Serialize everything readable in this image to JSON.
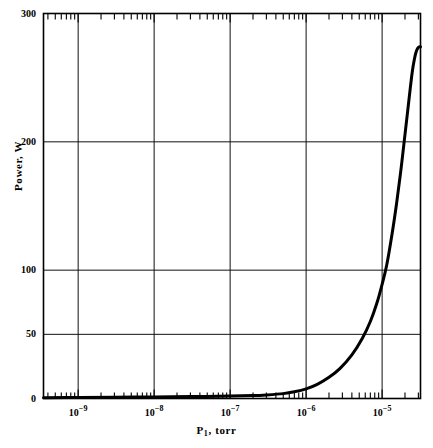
{
  "chart_data": {
    "type": "line",
    "title": "",
    "xlabel": "P, torr",
    "xlabel_base": "P",
    "xlabel_sub": "1",
    "xlabel_unit": ", torr",
    "ylabel": "Power, W",
    "xscale": "log",
    "yscale": "linear",
    "xlim": [
      3.5e-10,
      3.2e-05
    ],
    "ylim": [
      0,
      300
    ],
    "grid": true,
    "legend": null,
    "xticks": [
      {
        "value": 1e-09,
        "label": "10",
        "exp": "−9"
      },
      {
        "value": 1e-08,
        "label": "10",
        "exp": "−8"
      },
      {
        "value": 1e-07,
        "label": "10",
        "exp": "−7"
      },
      {
        "value": 1e-06,
        "label": "10",
        "exp": "−6"
      },
      {
        "value": 1e-05,
        "label": "10",
        "exp": "−5"
      }
    ],
    "yticks": [
      {
        "value": 0,
        "label": "0"
      },
      {
        "value": 50,
        "label": "50"
      },
      {
        "value": 100,
        "label": "100"
      },
      {
        "value": 200,
        "label": "200"
      },
      {
        "value": 300,
        "label": "300"
      }
    ],
    "series": [
      {
        "name": "power",
        "color": "#000000",
        "linewidth": 3.0,
        "points": [
          [
            3.5e-10,
            0.6
          ],
          [
            1e-09,
            0.8
          ],
          [
            3e-09,
            1.0
          ],
          [
            1e-08,
            1.2
          ],
          [
            3e-08,
            1.5
          ],
          [
            1e-07,
            1.9
          ],
          [
            2e-07,
            2.3
          ],
          [
            3e-07,
            2.8
          ],
          [
            5e-07,
            3.8
          ],
          [
            7e-07,
            5.2
          ],
          [
            1e-06,
            7.5
          ],
          [
            1.4e-06,
            11.0
          ],
          [
            2e-06,
            16.5
          ],
          [
            2.8e-06,
            23.5
          ],
          [
            4e-06,
            34.0
          ],
          [
            5.5e-06,
            47.0
          ],
          [
            7e-06,
            60.0
          ],
          [
            8.5e-06,
            74.0
          ],
          [
            1e-05,
            89.0
          ],
          [
            1.15e-05,
            104.0
          ],
          [
            1.35e-05,
            128.0
          ],
          [
            1.55e-05,
            152.0
          ],
          [
            1.75e-05,
            176.0
          ],
          [
            1.95e-05,
            200.0
          ],
          [
            2.15e-05,
            222.0
          ],
          [
            2.35e-05,
            242.0
          ],
          [
            2.5e-05,
            255.0
          ],
          [
            2.65e-05,
            264.0
          ],
          [
            2.8e-05,
            270.0
          ],
          [
            2.95e-05,
            273.0
          ],
          [
            3.1e-05,
            274.0
          ],
          [
            3.2e-05,
            274.0
          ]
        ]
      }
    ]
  },
  "axes": {
    "frame_color": "#000000",
    "grid_color": "#111111",
    "background": "#ffffff"
  }
}
